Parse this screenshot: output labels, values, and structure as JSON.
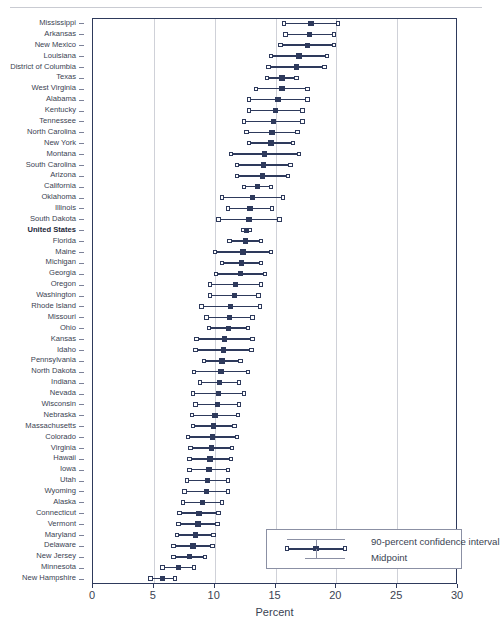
{
  "chart_data": {
    "type": "scatter",
    "title": "",
    "xlabel": "Percent",
    "ylabel": "",
    "xlim": [
      0,
      30
    ],
    "xticks": [
      0,
      5,
      10,
      15,
      20,
      25,
      30
    ],
    "grid": true,
    "legend_position": "bottom-right",
    "legend": [
      "90-percent confidence interval",
      "Midpoint"
    ],
    "categories": [
      "Mississippi",
      "Arkansas",
      "New Mexico",
      "Louisiana",
      "District of Columbia",
      "Texas",
      "West Virginia",
      "Alabama",
      "Kentucky",
      "Tennessee",
      "North Carolina",
      "New York",
      "Montana",
      "South Carolina",
      "Arizona",
      "California",
      "Oklahoma",
      "Illinois",
      "South Dakota",
      "United States",
      "Florida",
      "Maine",
      "Michigan",
      "Georgia",
      "Oregon",
      "Washington",
      "Rhode Island",
      "Missouri",
      "Ohio",
      "Kansas",
      "Idaho",
      "Pennsylvania",
      "North Dakota",
      "Indiana",
      "Nevada",
      "Wisconsin",
      "Nebraska",
      "Massachusetts",
      "Colorado",
      "Virginia",
      "Hawaii",
      "Iowa",
      "Utah",
      "Wyoming",
      "Alaska",
      "Connecticut",
      "Vermont",
      "Maryland",
      "Delaware",
      "New Jersey",
      "Minnesota",
      "New Hampshire"
    ],
    "highlight_category": "United States",
    "series": [
      {
        "name": "Midpoint",
        "values": [
          18.0,
          17.9,
          17.7,
          17.0,
          16.8,
          15.6,
          15.6,
          15.3,
          15.1,
          14.9,
          14.8,
          14.7,
          14.2,
          14.1,
          14.0,
          13.6,
          13.2,
          13.0,
          12.9,
          12.7,
          12.6,
          12.4,
          12.3,
          12.2,
          11.8,
          11.7,
          11.4,
          11.3,
          11.2,
          10.9,
          10.8,
          10.7,
          10.6,
          10.5,
          10.4,
          10.3,
          10.1,
          10.0,
          9.9,
          9.8,
          9.7,
          9.6,
          9.5,
          9.4,
          9.1,
          8.8,
          8.7,
          8.5,
          8.3,
          8.0,
          7.1,
          5.8
        ]
      },
      {
        "name": "CI lower bound",
        "values": [
          15.8,
          15.9,
          15.5,
          14.7,
          14.5,
          14.4,
          13.5,
          12.9,
          12.9,
          12.5,
          12.7,
          12.9,
          11.4,
          11.9,
          11.9,
          12.5,
          10.7,
          11.2,
          10.4,
          12.4,
          11.3,
          10.1,
          10.7,
          10.2,
          9.7,
          9.7,
          9.0,
          9.4,
          9.6,
          8.6,
          8.5,
          9.2,
          8.4,
          8.9,
          8.3,
          8.5,
          8.2,
          8.3,
          7.9,
          8.1,
          8.0,
          8.0,
          7.8,
          7.6,
          7.5,
          7.2,
          7.1,
          7.0,
          6.7,
          6.7,
          5.8,
          4.8
        ]
      },
      {
        "name": "CI upper bound",
        "values": [
          20.2,
          19.9,
          19.9,
          19.3,
          19.1,
          16.8,
          17.7,
          17.7,
          17.3,
          17.3,
          16.9,
          16.5,
          17.0,
          16.3,
          16.1,
          14.7,
          15.7,
          14.8,
          15.4,
          13.0,
          13.9,
          14.7,
          13.9,
          14.2,
          13.9,
          13.7,
          13.8,
          13.2,
          12.8,
          13.2,
          13.1,
          12.2,
          12.8,
          12.1,
          12.5,
          12.1,
          12.0,
          11.7,
          11.9,
          11.5,
          11.4,
          11.2,
          11.2,
          11.2,
          10.7,
          10.4,
          10.3,
          10.0,
          9.9,
          9.3,
          8.4,
          6.8
        ]
      }
    ]
  },
  "colors": {
    "marker": "#2e3a5c",
    "axis": "#2e3a5c",
    "grid": "#cfd1d8",
    "text": "#3a3f52"
  }
}
